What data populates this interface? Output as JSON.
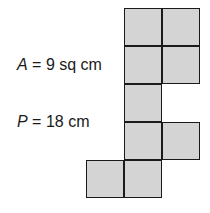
{
  "labels": {
    "area": {
      "var": "A",
      "rest": " = 9 sq cm"
    },
    "perimeter": {
      "var": "P",
      "rest": " = 18 cm"
    }
  },
  "figure": {
    "unit_squares": 9,
    "fill_color": "#d4d4d4",
    "stroke_color": "#1a1a1a",
    "cells": [
      [
        1,
        0
      ],
      [
        2,
        0
      ],
      [
        1,
        1
      ],
      [
        2,
        1
      ],
      [
        1,
        2
      ],
      [
        1,
        3
      ],
      [
        2,
        3
      ],
      [
        0,
        4
      ],
      [
        1,
        4
      ]
    ]
  }
}
